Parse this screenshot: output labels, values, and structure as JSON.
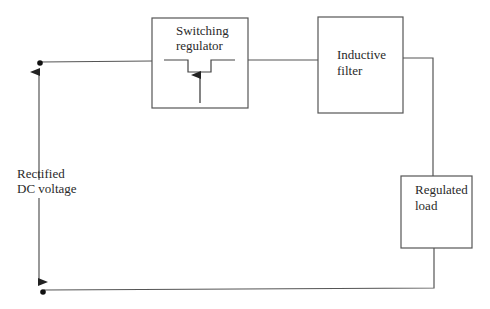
{
  "diagram": {
    "type": "block-diagram",
    "title": "",
    "blocks": [
      {
        "id": "switching-regulator",
        "label_line1": "Switching",
        "label_line2": "regulator"
      },
      {
        "id": "inductive-filter",
        "label_line1": "Inductive",
        "label_line2": "filter"
      },
      {
        "id": "regulated-load",
        "label_line1": "Regulated",
        "label_line2": "load"
      }
    ],
    "input": {
      "label_line1": "Rectified",
      "label_line2": "DC voltage"
    },
    "connections": [
      [
        "input-top-terminal",
        "switching-regulator"
      ],
      [
        "switching-regulator",
        "inductive-filter"
      ],
      [
        "inductive-filter",
        "regulated-load"
      ],
      [
        "regulated-load",
        "input-bottom-terminal"
      ]
    ],
    "colors": {
      "line": "#555555",
      "text": "#2a2a2a",
      "background": "#ffffff"
    }
  }
}
